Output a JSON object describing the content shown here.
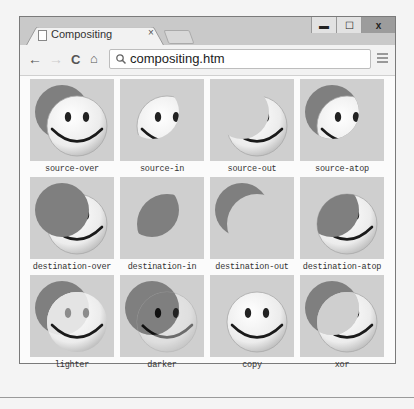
{
  "browser": {
    "tab": {
      "title": "Compositing",
      "close": "×",
      "icon": "page-icon"
    },
    "window_controls": {
      "minimize": "▬",
      "maximize": "☐",
      "close": "x"
    },
    "nav": {
      "back": "←",
      "forward": "→",
      "reload": "C",
      "home": "⌂"
    },
    "address": {
      "search_icon": "🔍",
      "value": "compositing.htm"
    },
    "menu_icon": "hamburger-icon"
  },
  "colors": {
    "cell_bg": "#cfcfcf",
    "dest_circle": "#7f7f7f",
    "face": "#f0f0f0",
    "chrome": "#c9c9c9"
  },
  "tiles": [
    {
      "label": "source-over",
      "mode": "source-over"
    },
    {
      "label": "source-in",
      "mode": "source-in"
    },
    {
      "label": "source-out",
      "mode": "source-out"
    },
    {
      "label": "source-atop",
      "mode": "source-atop"
    },
    {
      "label": "destination-over",
      "mode": "destination-over"
    },
    {
      "label": "destination-in",
      "mode": "destination-in"
    },
    {
      "label": "destination-out",
      "mode": "destination-out"
    },
    {
      "label": "destination-atop",
      "mode": "destination-atop"
    },
    {
      "label": "lighter",
      "mode": "lighter"
    },
    {
      "label": "darker",
      "mode": "darker"
    },
    {
      "label": "copy",
      "mode": "copy"
    },
    {
      "label": "xor",
      "mode": "xor"
    }
  ]
}
